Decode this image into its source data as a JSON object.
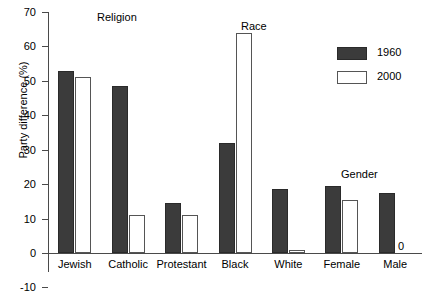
{
  "chart_data": {
    "type": "bar",
    "title": "",
    "xlabel": "",
    "ylabel": "Party difference (%)",
    "ylim": [
      -10,
      70
    ],
    "yticks": [
      -10,
      0,
      10,
      20,
      30,
      40,
      50,
      60,
      70
    ],
    "ytick_labels": [
      "-10",
      "0",
      "10",
      "20",
      "30",
      "40",
      "50",
      "60",
      "70"
    ],
    "grid": false,
    "legend_position": "top-right",
    "categories": [
      "Jewish",
      "Catholic",
      "Protestant",
      "Black",
      "White",
      "Female",
      "Male"
    ],
    "series": [
      {
        "name": "1960",
        "color": "#3b3b3b",
        "values": [
          53,
          48.5,
          14.5,
          32,
          18.5,
          19.5,
          17.5
        ]
      },
      {
        "name": "2000",
        "color": "#ffffff",
        "values": [
          51,
          11,
          11,
          64,
          1,
          15.5,
          0
        ]
      }
    ],
    "annotations": [
      {
        "text": "Religion",
        "group": "religion"
      },
      {
        "text": "Race",
        "group": "race"
      },
      {
        "text": "Gender",
        "group": "gender"
      },
      {
        "text": "0",
        "group": "male-2000-zero"
      }
    ]
  },
  "legend": {
    "items": [
      {
        "label": "1960",
        "style": "filled"
      },
      {
        "label": "2000",
        "style": "outlined"
      }
    ]
  }
}
